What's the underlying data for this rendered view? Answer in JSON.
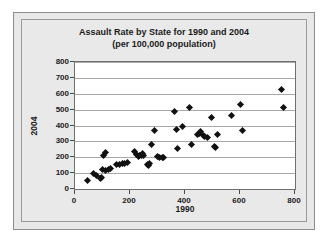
{
  "chart_data": {
    "type": "scatter",
    "title": "Assault Rate by State for 1990 and 2004",
    "subtitle": "(per 100,000 population)",
    "xlabel": "1990",
    "ylabel": "2004",
    "xlim": [
      0,
      800
    ],
    "ylim": [
      0,
      800
    ],
    "xticks": [
      0,
      200,
      400,
      600,
      800
    ],
    "yticks": [
      0,
      100,
      200,
      300,
      400,
      500,
      600,
      700,
      800
    ],
    "grid": "horizontal",
    "legend": "none",
    "marker": "diamond",
    "marker_color": "#111111",
    "series": [
      {
        "name": "States",
        "points": [
          [
            45,
            52
          ],
          [
            68,
            98
          ],
          [
            78,
            88
          ],
          [
            92,
            66
          ],
          [
            95,
            72
          ],
          [
            100,
            120
          ],
          [
            103,
            212
          ],
          [
            110,
            228
          ],
          [
            112,
            118
          ],
          [
            120,
            122
          ],
          [
            128,
            128
          ],
          [
            150,
            152
          ],
          [
            160,
            155
          ],
          [
            172,
            162
          ],
          [
            180,
            160
          ],
          [
            192,
            168
          ],
          [
            215,
            238
          ],
          [
            222,
            218
          ],
          [
            232,
            205
          ],
          [
            236,
            212
          ],
          [
            240,
            208
          ],
          [
            245,
            225
          ],
          [
            250,
            210
          ],
          [
            262,
            152
          ],
          [
            268,
            148
          ],
          [
            272,
            158
          ],
          [
            278,
            278
          ],
          [
            288,
            368
          ],
          [
            300,
            205
          ],
          [
            308,
            198
          ],
          [
            318,
            200
          ],
          [
            322,
            196
          ],
          [
            360,
            488
          ],
          [
            368,
            372
          ],
          [
            372,
            258
          ],
          [
            392,
            392
          ],
          [
            418,
            515
          ],
          [
            424,
            282
          ],
          [
            444,
            345
          ],
          [
            452,
            352
          ],
          [
            458,
            360
          ],
          [
            468,
            340
          ],
          [
            472,
            328
          ],
          [
            480,
            326
          ],
          [
            498,
            450
          ],
          [
            508,
            268
          ],
          [
            512,
            262
          ],
          [
            518,
            342
          ],
          [
            568,
            462
          ],
          [
            602,
            530
          ],
          [
            608,
            368
          ],
          [
            752,
            628
          ],
          [
            758,
            512
          ]
        ]
      }
    ]
  }
}
